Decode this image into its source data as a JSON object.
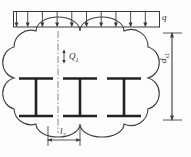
{
  "figure": {
    "line_color": "#2b2b2b",
    "thin_line_color": "#555555",
    "background_color": "#fdfdfd"
  },
  "load": {
    "symbol": "q",
    "type": "uniformly-distributed-load",
    "arrow_count": 10,
    "bar_left": 13,
    "bar_right": 160,
    "bar_top": 11,
    "bar_bottom": 27,
    "direction": "downward"
  },
  "labels": {
    "q": "q",
    "Q1_main": "Q",
    "Q1_sub": "1",
    "l2_main": "l",
    "l2_sub": "2",
    "ds1_main": "d",
    "ds1_sub": "s1"
  },
  "dimensions": {
    "vertical": {
      "symbol": "d",
      "subscript": "s1",
      "name": "overall-section-depth",
      "line_x": 172,
      "top_y": 33,
      "bottom_y": 120
    },
    "horizontal": {
      "symbol": "l",
      "subscript": "2",
      "name": "beam-spacing",
      "line_y": 140,
      "left_x": 48,
      "right_x": 80
    },
    "internal": {
      "symbol": "Q",
      "subscript": "1",
      "name": "shear-force-internal",
      "arrow_x": 64,
      "arrow_top": 50,
      "arrow_bottom": 62
    }
  },
  "beams": {
    "count": 3,
    "type": "I-section",
    "flange_top_y": 78,
    "flange_bottom_y": 116,
    "centers": [
      36,
      80,
      124
    ],
    "flange_half_width": 18,
    "web_thickness": 3
  },
  "concrete_outline": {
    "shape": "scalloped-cloud",
    "left": 14,
    "right": 148,
    "top": 31,
    "bottom": 124,
    "lobe_count_horizontal": 3,
    "lobe_count_vertical": 3
  },
  "centerline": {
    "style": "dash-dot",
    "x": 58,
    "top_y": 31,
    "bottom_y": 133
  }
}
